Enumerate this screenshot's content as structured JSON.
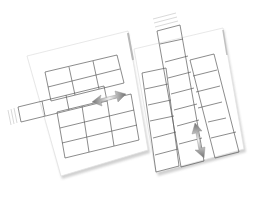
{
  "illustration": {
    "subject": "two table pages showing column and row insertion",
    "left_page": {
      "grid": {
        "rows": 5,
        "cols": 3
      },
      "inserted": "row",
      "arrow": "horizontal-double-arrow"
    },
    "right_page": {
      "grid": {
        "rows": 7,
        "cols": 3
      },
      "inserted": "column",
      "arrow": "vertical-double-arrow"
    }
  },
  "colors": {
    "page": "#ffffff",
    "page_shadow": "#cfcfcf",
    "grid_line": "#5a5a5a",
    "arrow_light": "#f0f0f0",
    "arrow_dark": "#6e6e6e"
  }
}
